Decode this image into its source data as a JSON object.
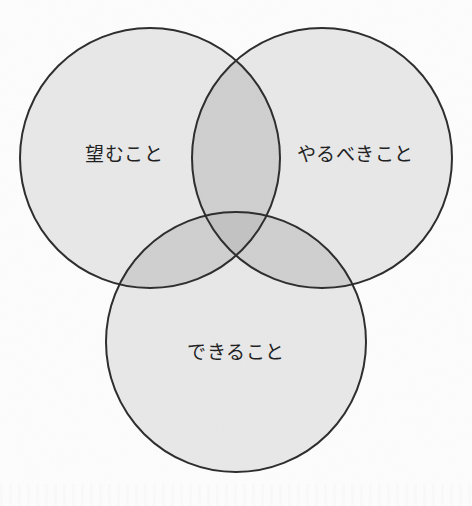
{
  "figure": {
    "type": "venn-diagram",
    "set_count": 3,
    "background_color": "#fdfdfd",
    "stroke_color": "#2b2b2b",
    "stroke_width": 2,
    "fill_single": "#e8e8e8",
    "fill_pair_overlap": "#cfcfcf",
    "fill_triple_overlap": "#c2c2c2",
    "label_color": "#1d1d1d"
  },
  "chart_data": {
    "type": "venn",
    "title": "",
    "sets": [
      {
        "id": "want",
        "label": "望むこと",
        "position": "top-left",
        "center_x": 150,
        "center_y": 158,
        "radius": 130,
        "label_x": 124,
        "label_y": 155
      },
      {
        "id": "should",
        "label": "やるべきこと",
        "position": "top-right",
        "center_x": 322,
        "center_y": 158,
        "radius": 130,
        "label_x": 355,
        "label_y": 155
      },
      {
        "id": "can",
        "label": "できること",
        "position": "bottom",
        "center_x": 236,
        "center_y": 342,
        "radius": 130,
        "label_x": 236,
        "label_y": 353
      }
    ],
    "intersections": [
      {
        "sets": [
          "want",
          "should"
        ],
        "label": ""
      },
      {
        "sets": [
          "want",
          "can"
        ],
        "label": ""
      },
      {
        "sets": [
          "should",
          "can"
        ],
        "label": ""
      },
      {
        "sets": [
          "want",
          "should",
          "can"
        ],
        "label": ""
      }
    ],
    "legend": null,
    "grid": false
  }
}
